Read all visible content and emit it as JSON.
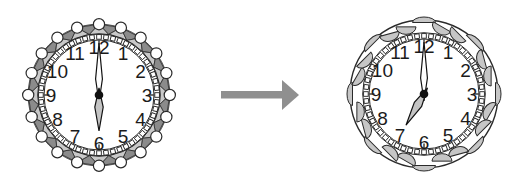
{
  "figure": {
    "background": "#ffffff"
  },
  "left_clock": {
    "kind": "beaded-triangle-rim-clock",
    "time": "6:00",
    "hour": 6,
    "minute": 0,
    "numerals": [
      "1",
      "2",
      "3",
      "4",
      "5",
      "6",
      "7",
      "8",
      "9",
      "10",
      "11",
      "12"
    ],
    "style": {
      "band_dark": "#8b8b8b",
      "band_light": "#c9c9c9",
      "bead_fill": "#ffffff",
      "outline": "#2a2a2a",
      "face_fill": "#ffffff",
      "minute_hand_fill": "#ffffff",
      "hour_hand_fill": "#c4c4c4",
      "numeral_color": "#1b1b1b"
    }
  },
  "right_clock": {
    "kind": "scalloped-rim-clock",
    "time": "7:00",
    "hour": 7,
    "minute": 0,
    "numerals": [
      "1",
      "2",
      "3",
      "4",
      "5",
      "6",
      "7",
      "8",
      "9",
      "10",
      "11",
      "12"
    ],
    "style": {
      "scallop_fill": "#c6c6c6",
      "outline": "#2a2a2a",
      "face_fill": "#ffffff",
      "minute_hand_fill": "#ffffff",
      "hour_hand_fill": "#c4c4c4",
      "numeral_color": "#1b1b1b"
    }
  },
  "arrow": {
    "direction": "right",
    "color": "#8f8f8f"
  }
}
